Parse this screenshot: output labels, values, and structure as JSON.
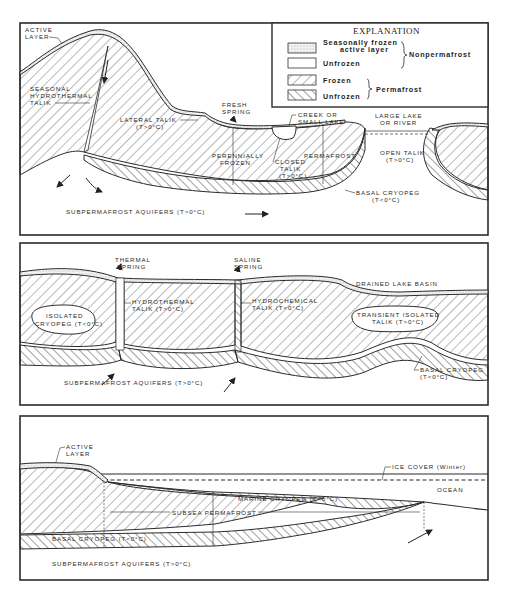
{
  "legend": {
    "title": "EXPLANATION",
    "items": [
      {
        "pattern": "stippled",
        "label_line1": "Seasonally frozen",
        "label_line2": "active layer"
      },
      {
        "pattern": "blank",
        "label_line1": "Unfrozen"
      },
      {
        "pattern": "hatch-frozen",
        "label_line1": "Frozen"
      },
      {
        "pattern": "hatch-unfrozen",
        "label_line1": "Unfrozen"
      }
    ],
    "groups": [
      {
        "label": "Nonpermafrost",
        "items": [
          0,
          1
        ]
      },
      {
        "label": "Permafrost",
        "items": [
          2,
          3
        ]
      }
    ]
  },
  "panel1": {
    "labels": {
      "active_layer_1": "ACTIVE",
      "active_layer_2": "LAYER",
      "seasonal_1": "SEASONAL",
      "seasonal_2": "HYDROTHERMAL",
      "seasonal_3": "TALIK",
      "fresh_1": "FRESH",
      "fresh_2": "SPRING",
      "lateral_1": "LATERAL TALIK",
      "lateral_2": "(T>0°C)",
      "creek_1": "CREEK OR",
      "creek_2": "SMALL LAKE",
      "lake_1": "LARGE LAKE",
      "lake_2": "OR RIVER",
      "perennially_1": "PERENNIALLY",
      "perennially_2": "FROZEN",
      "closed_1": "CLOSED",
      "closed_2": "TALIK",
      "closed_3": "(T>0°C)",
      "permafrost": "PERMAFROST",
      "open_1": "OPEN TALIK",
      "open_2": "(T>0°C)",
      "basal_1": "BASAL CRYOPEG",
      "basal_2": "(T<0°C)",
      "aquifers": "SUBPERMAFROST AQUIFERS (T>0°C)"
    }
  },
  "panel2": {
    "labels": {
      "thermal_1": "THERMAL",
      "thermal_2": "SPRING",
      "saline_1": "SALINE",
      "saline_2": "SPRING",
      "drained": "DRAINED LAKE BASIN",
      "isolated_1": "ISOLATED",
      "isolated_2": "CRYOPEG (T<0°C)",
      "hydrothermal_1": "HYDROTHERMAL",
      "hydrothermal_2": "TALIK (T>0°C)",
      "hydrochemical_1": "HYDROCHEMICAL",
      "hydrochemical_2": "TALIK (T<0°C)",
      "transient_1": "TRANSIENT ISOLATED",
      "transient_2": "TALIK (T>0°C)",
      "basal_1": "BASAL CRYOPEG",
      "basal_2": "(T<0°C)",
      "aquifers": "SUBPERMAFROST AQUIFERS (T>0°C)"
    }
  },
  "panel3": {
    "labels": {
      "active_1": "ACTIVE",
      "active_2": "LAYER",
      "ice": "ICE COVER (Winter)",
      "ocean": "OCEAN",
      "marine": "MARINE CRYOPEG (T<0°C)",
      "subsea": "SUBSEA PERMAFROST",
      "basal": "BASAL CRYOPEG (T<0°C)",
      "aquifers": "SUBPERMAFROST AQUIFERS (T>0°C)"
    }
  }
}
